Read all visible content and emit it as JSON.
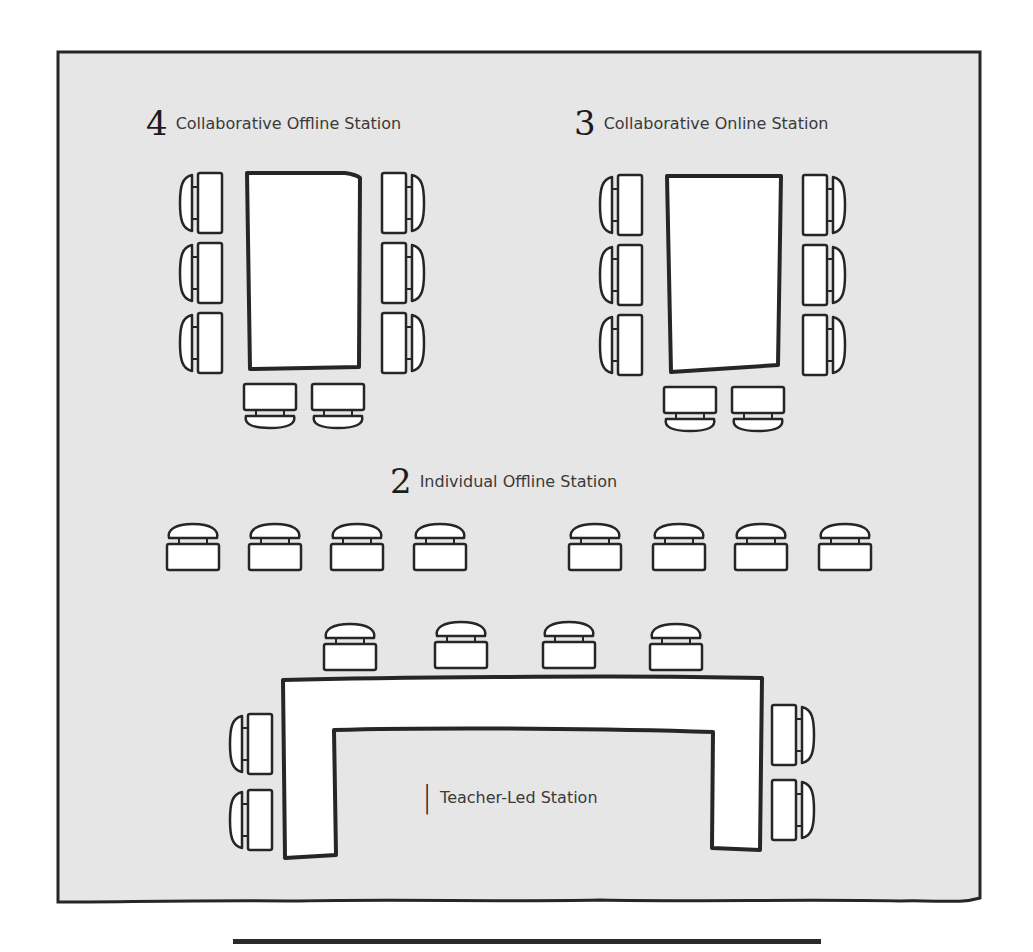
{
  "colors": {
    "floor": "#e6e6e6",
    "outline": "#262626",
    "furniture": "#ffffff",
    "page": "#ffffff"
  },
  "stations": [
    {
      "number": "4",
      "name": "Collaborative Offline Station",
      "table": "rectangular-table",
      "seats": 8
    },
    {
      "number": "3",
      "name": "Collaborative Online Station",
      "table": "rectangular-table",
      "seats": 8
    },
    {
      "number": "2",
      "name": "Individual Offline Station",
      "table": "none",
      "seats": 8
    },
    {
      "number": "1",
      "name": "Teacher-Led Station",
      "table": "u-shaped-table",
      "seats": 8
    }
  ],
  "icons": {
    "desk_chair": "desk-with-chair-icon",
    "table": "table-icon"
  }
}
